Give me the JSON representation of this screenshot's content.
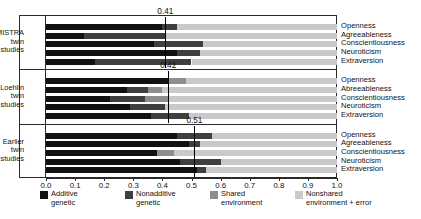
{
  "chart_data": {
    "type": "bar",
    "orientation": "horizontal",
    "stacked": true,
    "title": "",
    "xlabel": "",
    "ylabel": "",
    "xlim": [
      0.0,
      1.0
    ],
    "grid": false,
    "legend_position": "bottom",
    "xticks": [
      "0.0",
      "0.1",
      "0.2",
      "0.3",
      "0.4",
      "0.5",
      "0.6",
      "0.7",
      "0.8",
      "0.9",
      "1.0"
    ],
    "xtick_values": [
      0.0,
      0.1,
      0.2,
      0.3,
      0.4,
      0.5,
      0.6,
      0.7,
      0.8,
      0.9,
      1.0
    ],
    "series": [
      {
        "name": "Additive genetic",
        "color": "#111111"
      },
      {
        "name": "Nonadditive genetic",
        "color": "#3f3f3f"
      },
      {
        "name": "Shared environment",
        "color": "#8e8e8e"
      },
      {
        "name": "Nonshared environment + error",
        "color": "#c9c9c9"
      }
    ],
    "groups": [
      {
        "label": "MISTRA\ntwin\nstudies",
        "label_lines": [
          "MISTRA",
          "twin",
          "studies"
        ],
        "reference_line": 0.41,
        "reference_label": "0.41",
        "bars": [
          {
            "category": "Openness",
            "values": [
              0.4,
              0.05,
              0.0,
              0.55
            ]
          },
          {
            "category": "Agreeableness",
            "values": [
              0.13,
              0.28,
              0.0,
              0.59
            ]
          },
          {
            "category": "Conscientiousness",
            "values": [
              0.37,
              0.17,
              0.0,
              0.46
            ]
          },
          {
            "category": "Neuroticism",
            "values": [
              0.45,
              0.08,
              0.0,
              0.47
            ]
          },
          {
            "category": "Extraversion",
            "values": [
              0.17,
              0.33,
              0.0,
              0.5
            ]
          }
        ]
      },
      {
        "label": "Loehlin\ntwin\nstudies",
        "label_lines": [
          "Loehlin",
          "twin",
          "studies"
        ],
        "reference_line": 0.42,
        "reference_label": "0.42",
        "bars": [
          {
            "category": "Openness",
            "values": [
              0.42,
              0.0,
              0.06,
              0.52
            ]
          },
          {
            "category": "Abreeableness",
            "values": [
              0.28,
              0.07,
              0.05,
              0.6
            ]
          },
          {
            "category": "Conscientiousness",
            "values": [
              0.22,
              0.12,
              0.08,
              0.58
            ]
          },
          {
            "category": "Neuroticism",
            "values": [
              0.29,
              0.12,
              0.0,
              0.59
            ]
          },
          {
            "category": "Extraversion",
            "values": [
              0.36,
              0.13,
              0.0,
              0.51
            ]
          }
        ]
      },
      {
        "label": "Earlier\ntwin\nstudies",
        "label_lines": [
          "Earlier",
          "twin",
          "studies"
        ],
        "reference_line": 0.51,
        "reference_label": "0.51",
        "bars": [
          {
            "category": "Openness",
            "values": [
              0.45,
              0.12,
              0.0,
              0.43
            ]
          },
          {
            "category": "Agreeableness",
            "values": [
              0.49,
              0.04,
              0.0,
              0.47
            ]
          },
          {
            "category": "Conscientiousness",
            "values": [
              0.38,
              0.0,
              0.06,
              0.56
            ]
          },
          {
            "category": "Neuroticism",
            "values": [
              0.46,
              0.14,
              0.0,
              0.4
            ]
          },
          {
            "category": "Extraversion",
            "values": [
              0.52,
              0.03,
              0.0,
              0.45
            ]
          }
        ]
      }
    ]
  },
  "legend": {
    "items": [
      {
        "label_line1": "Additive",
        "label_line2": "genetic",
        "color": "#111111"
      },
      {
        "label_line1": "Nonadditive",
        "label_line2": "genetic",
        "color": "#3f3f3f"
      },
      {
        "label_line1": "Shared",
        "label_line2": "environment",
        "color": "#8e8e8e"
      },
      {
        "label_line1": "Nonshared",
        "label_line2": "environment + error",
        "color": "#c9c9c9"
      }
    ]
  }
}
